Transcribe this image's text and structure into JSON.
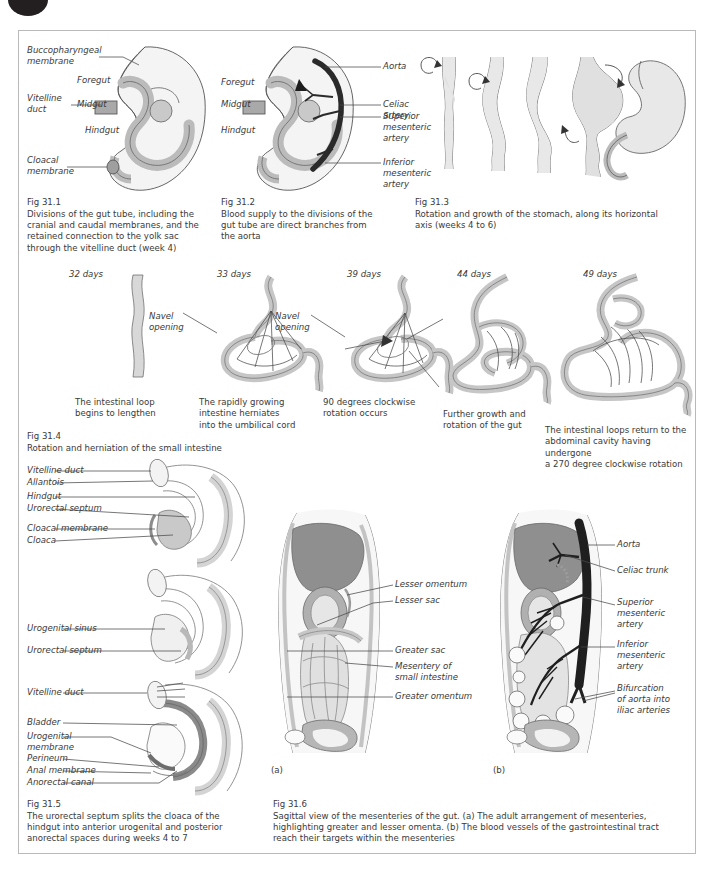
{
  "page": {
    "badge": "page-number-badge",
    "colors": {
      "ink": "#3a3a3a",
      "border": "#b9b9b9",
      "fill_light": "#ededed",
      "fill_mid": "#d6d6d6",
      "fill_dark": "#9a9a9a",
      "fill_darker": "#7c7c7c",
      "vessel_dark": "#262626",
      "badge": "#231f20"
    }
  },
  "figures": [
    {
      "id": "fig-31-1",
      "number": "Fig 31.1",
      "caption": "Divisions of the gut tube, including the\ncranial and caudal membranes, and the\nretained connection to the yolk sac\nthrough the vitelline duct (week 4)",
      "labels": [
        "Buccopharyngeal\nmembrane",
        "Vitelline\nduct",
        "Foregut",
        "Midgut",
        "Hindgut",
        "Cloacal\nmembrane"
      ]
    },
    {
      "id": "fig-31-2",
      "number": "Fig 31.2",
      "caption": "Blood supply to the divisions of the\ngut tube are direct branches from\nthe aorta",
      "labels": [
        "Foregut",
        "Midgut",
        "Hindgut",
        "Aorta",
        "Celiac artery",
        "Superior\nmesenteric\nartery",
        "Inferior\nmesenteric\nartery"
      ]
    },
    {
      "id": "fig-31-3",
      "number": "Fig 31.3",
      "caption": "Rotation and growth of the stomach, along its horizontal\naxis (weeks 4 to 6)",
      "labels": []
    },
    {
      "id": "fig-31-4",
      "number": "Fig 31.4",
      "caption": "Rotation and herniation of the small intestine",
      "stages": [
        {
          "day": "32 days",
          "note": "The intestinal loop\nbegins to lengthen",
          "callouts": []
        },
        {
          "day": "33 days",
          "note": "The rapidly growing\nintestine herniates\ninto the umbilical cord",
          "callouts": [
            "Navel\nopening"
          ]
        },
        {
          "day": "39 days",
          "note": "90 degrees clockwise\nrotation occurs",
          "callouts": [
            "Navel\nopening"
          ]
        },
        {
          "day": "44 days",
          "note": "Further growth and\nrotation of the gut",
          "callouts": []
        },
        {
          "day": "49 days",
          "note": "The intestinal loops return to the\nabdominal cavity having undergone\na 270 degree clockwise rotation",
          "callouts": []
        }
      ]
    },
    {
      "id": "fig-31-5",
      "number": "Fig 31.5",
      "caption": "The urorectal septum splits the cloaca of the\nhindgut into anterior urogenital and posterior\nanorectal spaces during weeks 4 to 7",
      "stages": [
        {
          "labels": [
            "Vitelline duct",
            "Allantois",
            "Hindgut",
            "Urorectal septum",
            "Cloacal membrane",
            "Cloaca"
          ]
        },
        {
          "labels": [
            "Urogenital sinus",
            "Urorectal septum"
          ]
        },
        {
          "labels": [
            "Vitelline duct",
            "Bladder",
            "Urogenital\nmembrane",
            "Perineum",
            "Anal membrane",
            "Anorectal canal"
          ]
        }
      ]
    },
    {
      "id": "fig-31-6",
      "number": "Fig 31.6",
      "caption": "Sagittal view of the mesenteries of the gut. (a) The adult arrangement of mesenteries,\nhighlighting greater and lesser omenta. (b) The blood vessels of the gastrointestinal tract\nreach their targets within the mesenteries",
      "panels": [
        {
          "key": "(a)",
          "labels": [
            "Lesser omentum",
            "Lesser sac",
            "Greater sac",
            "Mesentery of\nsmall intestine",
            "Greater omentum"
          ]
        },
        {
          "key": "(b)",
          "labels": [
            "Aorta",
            "Celiac trunk",
            "Superior\nmesenteric\nartery",
            "Inferior\nmesenteric\nartery",
            "Bifurcation\nof aorta into\niliac arteries"
          ]
        }
      ]
    }
  ]
}
